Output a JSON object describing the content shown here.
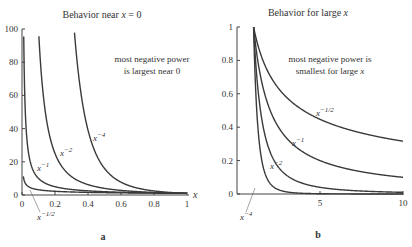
{
  "chart_data": [
    {
      "type": "line",
      "panel_label": "a",
      "title": "Behavior near x = 0",
      "xlabel": "x",
      "ylabel": "",
      "xlim": [
        0,
        1
      ],
      "ylim": [
        0,
        100
      ],
      "x_ticks": [
        "0",
        "0.2",
        "0.4",
        "0.6",
        "0.8",
        "1"
      ],
      "y_ticks": [
        "0",
        "20",
        "40",
        "60",
        "80",
        "100"
      ],
      "annotation": [
        "most negative power",
        "is largest near 0"
      ],
      "series": [
        {
          "name": "x^-1/2",
          "label_base": "x",
          "label_exp": "−1/2",
          "power": -0.5
        },
        {
          "name": "x^-1",
          "label_base": "x",
          "label_exp": "−1",
          "power": -1
        },
        {
          "name": "x^-2",
          "label_base": "x",
          "label_exp": "−2",
          "power": -2
        },
        {
          "name": "x^-4",
          "label_base": "x",
          "label_exp": "−4",
          "power": -4
        }
      ],
      "grid": false,
      "legend": "inline labels"
    },
    {
      "type": "line",
      "panel_label": "b",
      "title": "Behavior for large x",
      "xlabel": "",
      "ylabel": "",
      "xlim": [
        1,
        10
      ],
      "ylim": [
        0,
        1
      ],
      "x_ticks": [
        "5",
        "10"
      ],
      "y_ticks": [
        "0",
        "0.2",
        "0.4",
        "0.6",
        "0.8",
        "1"
      ],
      "annotation": [
        "most negative power is",
        "smallest for large x"
      ],
      "series": [
        {
          "name": "x^-1/2",
          "label_base": "x",
          "label_exp": "−1/2",
          "power": -0.5
        },
        {
          "name": "x^-1",
          "label_base": "x",
          "label_exp": "−1",
          "power": -1
        },
        {
          "name": "x^-2",
          "label_base": "x",
          "label_exp": "−2",
          "power": -2
        },
        {
          "name": "x^-4",
          "label_base": "x",
          "label_exp": "−4",
          "power": -4
        }
      ],
      "grid": false,
      "legend": "inline labels"
    }
  ]
}
